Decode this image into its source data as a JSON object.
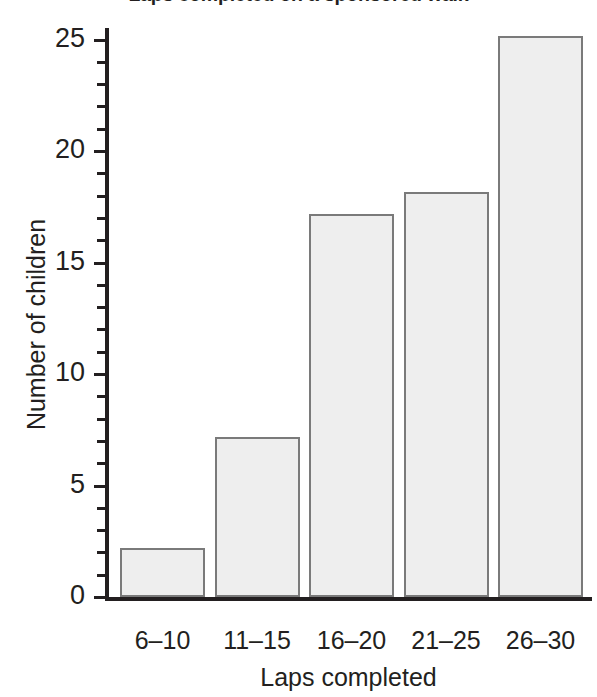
{
  "chart_data": {
    "type": "bar",
    "title": "Laps completed on a sponsored walk",
    "xlabel": "Laps completed",
    "ylabel": "Number of children",
    "categories": [
      "6–10",
      "11–15",
      "16–20",
      "21–25",
      "26–30"
    ],
    "values": [
      2,
      7,
      17,
      18,
      25
    ],
    "ylim": [
      0,
      25
    ],
    "ytick_labels": [
      "0",
      "5",
      "10",
      "15",
      "20",
      "25"
    ],
    "ytick_values": [
      0,
      5,
      10,
      15,
      20,
      25
    ],
    "minor_tick_step": 1,
    "grid": false,
    "legend": null,
    "bar_fill_color": "#eeeeee",
    "bar_border_color": "#7a7a7a",
    "axis_color": "#231f20",
    "background_color": "#ffffff"
  }
}
